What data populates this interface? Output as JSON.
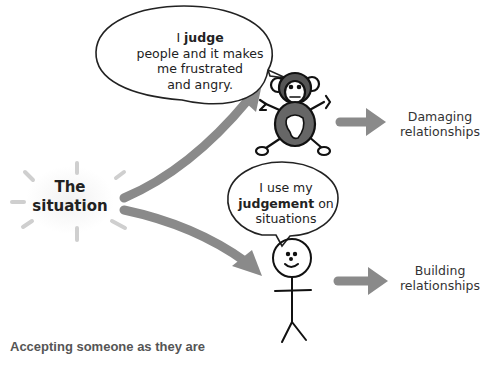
{
  "diagram": {
    "center": {
      "line1": "The",
      "line2": "situation"
    },
    "top_branch": {
      "bubble": {
        "prefix": "I ",
        "bold": "judge",
        "rest_line1": "people and it makes",
        "line2": "me frustrated",
        "line3": "and angry."
      },
      "figure_icon": "monkey-icon",
      "outcome": {
        "line1": "Damaging",
        "line2": "relationships"
      }
    },
    "bottom_branch": {
      "bubble": {
        "line1": "I use my",
        "bold": "judgement",
        "after_bold": " on",
        "line3": "situations"
      },
      "figure_icon": "stick-figure-icon",
      "outcome": {
        "line1": "Building",
        "line2": "relationships"
      }
    },
    "arrow_color": "#8a8a8a",
    "monkey_body_color": "#666666"
  },
  "caption": "Accepting someone as they are"
}
